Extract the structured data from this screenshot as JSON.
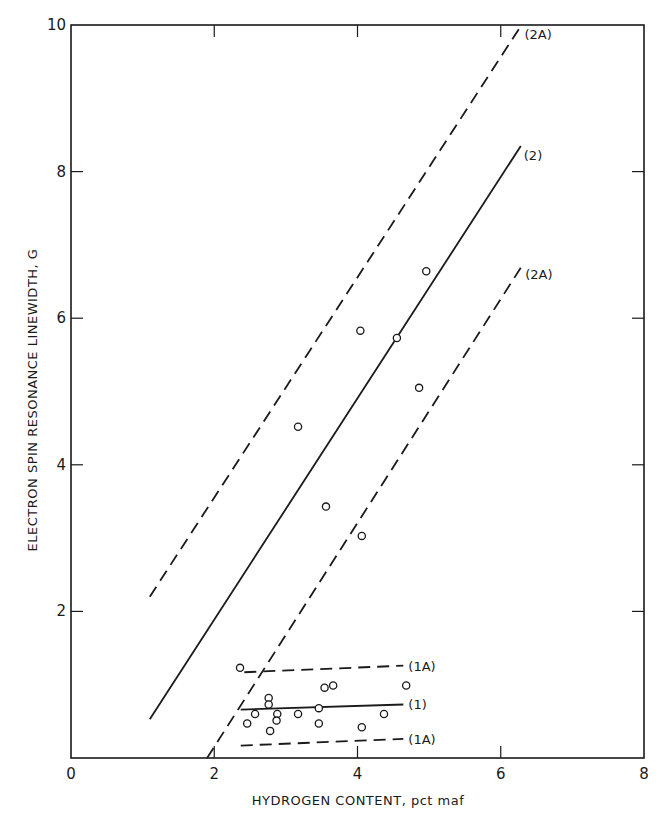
{
  "chart_data": {
    "type": "scatter",
    "title": "",
    "xlabel": "HYDROGEN CONTENT, pct maf",
    "ylabel": "ELECTRON SPIN RESONANCE LINEWIDTH, G",
    "xlim": [
      0,
      8
    ],
    "ylim": [
      0,
      10
    ],
    "x_ticks": [
      0,
      2,
      4,
      6,
      8
    ],
    "y_ticks": [
      2,
      4,
      6,
      8,
      10
    ],
    "x_tick_labels": [
      "0",
      "2",
      "4",
      "6",
      "8"
    ],
    "y_tick_labels": [
      "2",
      "4",
      "6",
      "8",
      "10"
    ],
    "grid": false,
    "legend": null,
    "series": [
      {
        "name": "Data points",
        "kind": "scatter",
        "marker": "open-circle",
        "points": [
          [
            4.96,
            6.64
          ],
          [
            4.04,
            5.83
          ],
          [
            4.55,
            5.73
          ],
          [
            4.86,
            5.05
          ],
          [
            3.17,
            4.52
          ],
          [
            3.56,
            3.43
          ],
          [
            4.06,
            3.03
          ],
          [
            2.36,
            1.23
          ],
          [
            3.54,
            0.96
          ],
          [
            3.66,
            0.99
          ],
          [
            4.68,
            0.99
          ],
          [
            2.76,
            0.82
          ],
          [
            2.76,
            0.73
          ],
          [
            3.46,
            0.68
          ],
          [
            2.57,
            0.6
          ],
          [
            2.88,
            0.6
          ],
          [
            3.17,
            0.6
          ],
          [
            4.37,
            0.6
          ],
          [
            2.46,
            0.47
          ],
          [
            2.87,
            0.51
          ],
          [
            3.46,
            0.47
          ],
          [
            4.06,
            0.42
          ],
          [
            2.78,
            0.37
          ]
        ]
      },
      {
        "name": "(2)",
        "kind": "line",
        "style": "solid",
        "points": [
          [
            1.1,
            0.53
          ],
          [
            6.28,
            8.35
          ]
        ]
      },
      {
        "name": "(2A)",
        "kind": "line",
        "style": "dashed",
        "points": [
          [
            1.1,
            2.2
          ],
          [
            6.29,
            10.0
          ]
        ]
      },
      {
        "name": "(2A)",
        "kind": "line",
        "style": "dashed",
        "points": [
          [
            1.9,
            0.0
          ],
          [
            6.3,
            6.72
          ]
        ]
      },
      {
        "name": "(1)",
        "kind": "line",
        "style": "solid",
        "points": [
          [
            2.37,
            0.66
          ],
          [
            4.64,
            0.73
          ]
        ]
      },
      {
        "name": "(1A)",
        "kind": "line",
        "style": "dashed",
        "points": [
          [
            2.42,
            1.17
          ],
          [
            4.64,
            1.26
          ]
        ]
      },
      {
        "name": "(1A)",
        "kind": "line",
        "style": "dashed",
        "points": [
          [
            2.37,
            0.17
          ],
          [
            4.64,
            0.26
          ]
        ]
      }
    ],
    "annotations": [
      "(2A)",
      "(2)",
      "(2A)",
      "(1A)",
      "(1)",
      "(1A)"
    ]
  },
  "labels": {
    "x_axis_title": "HYDROGEN CONTENT, pct maf",
    "y_axis_title": "ELECTRON SPIN RESONANCE LINEWIDTH, G"
  }
}
